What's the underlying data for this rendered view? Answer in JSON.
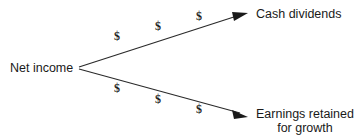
{
  "diagram": {
    "type": "flow-branch",
    "background_color": "#ffffff",
    "line_color": "#2a2a2a",
    "text_color": "#1a1a1a",
    "source": {
      "id": "net-income",
      "label": "Net income"
    },
    "branches": [
      {
        "id": "cash-dividends",
        "label": "Cash dividends",
        "direction": "up",
        "markers": [
          "$",
          "$",
          "$"
        ]
      },
      {
        "id": "earnings-retained",
        "label_line1": "Earnings retained",
        "label_line2": "for growth",
        "direction": "down",
        "markers": [
          "$",
          "$",
          "$"
        ]
      }
    ],
    "marker_symbol": "$"
  }
}
